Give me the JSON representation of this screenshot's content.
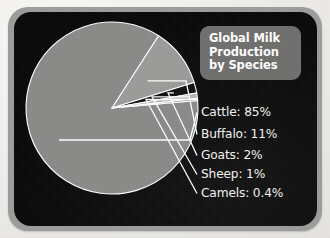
{
  "title": {
    "lines": [
      "Global Milk",
      "Production",
      "by Species"
    ],
    "full": "Global Milk Production by Species",
    "box_color": "#6f6f6d",
    "text_color": "#ffffff"
  },
  "panel": {
    "background": "#0a0a0a",
    "frame_color": "#9d9d9b",
    "page_background": "#efeeec"
  },
  "legend": [
    {
      "label": "Cattle: 85%",
      "name": "Cattle",
      "value": 85,
      "color": "#8b8b89",
      "y": 118
    },
    {
      "label": "Buffalo: 11%",
      "name": "Buffalo",
      "value": 11,
      "color": "#9c9c9a",
      "y": 140
    },
    {
      "label": "Goats: 2%",
      "name": "Goats",
      "value": 2,
      "color": "#111111",
      "y": 161
    },
    {
      "label": "Sheep: 1%",
      "name": "Sheep",
      "value": 1,
      "color": "#b6b6b3",
      "y": 180
    },
    {
      "label": "Camels: 0.4%",
      "name": "Camels",
      "value": 0.4,
      "color": "#8b8b89",
      "y": 199
    }
  ],
  "chart_data": {
    "type": "pie",
    "title": "Global Milk Production by Species",
    "subtitle": "",
    "xlabel": "",
    "ylabel": "",
    "unit": "percent",
    "categories": [
      "Cattle",
      "Buffalo",
      "Goats",
      "Sheep",
      "Camels"
    ],
    "values": [
      85,
      11,
      2,
      1,
      0.4
    ],
    "labels": [
      "Cattle: 85%",
      "Buffalo: 11%",
      "Goats: 2%",
      "Sheep: 1%",
      "Camels: 0.4%"
    ],
    "colors": [
      "#8b8b89",
      "#9c9c9a",
      "#111111",
      "#b6b6b3",
      "#8b8b89"
    ],
    "slice_separator_color": "#ffffff",
    "legend_position": "right",
    "grid": false,
    "start_angle_deg": -5,
    "direction": "clockwise",
    "geometry": {
      "cx": 112,
      "cy": 108,
      "r": 86
    }
  }
}
